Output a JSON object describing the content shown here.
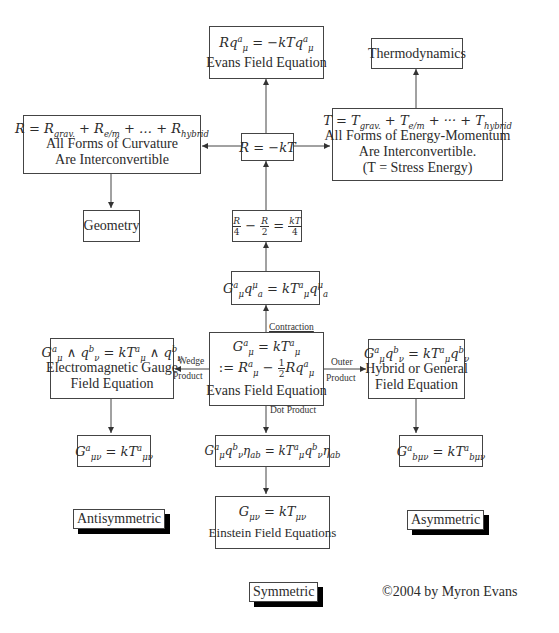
{
  "diagram": {
    "nodes": {
      "evans_top": {
        "equation": "Rq^a_μ = −kTq^a_μ",
        "label": "Evans Field Equation"
      },
      "thermodynamics": {
        "label": "Thermodynamics"
      },
      "curvature": {
        "equation": "R = R_grav. + R_e/m + … + R_hybrid",
        "line1": "All Forms of Curvature",
        "line2": "Are Interconvertible"
      },
      "r_eq": {
        "equation": "R = −kT"
      },
      "energy": {
        "equation": "T = T_grav. + T_e/m + ··· + T_hybrid",
        "line1": "All Forms of Energy-Momentum",
        "line2": "Are Interconvertible.",
        "line3": "(T = Stress Energy)"
      },
      "geometry": {
        "label": "Geometry"
      },
      "fraction_eq": {
        "equation": "R/4 − R/2 = kT/4"
      },
      "contraction_eq": {
        "equation": "G^a_μ q^μ_a = kT^a_μ q^μ_a"
      },
      "evans_center": {
        "equation1": "G^a_μ = kT^a_μ",
        "equation2": ":= R^a_μ − ½Rq^a_μ",
        "label": "Evans Field Equation"
      },
      "em_gauge": {
        "equation": "G^a_μ ∧ q^b_ν = kT^a_μ ∧ q^b_ν",
        "line1": "Electromagnetic Gauge",
        "line2": "Field Equation"
      },
      "hybrid": {
        "equation": "G^a_μ q^b_ν = kT^a_μ q^b_ν",
        "line1": "Hybrid or General",
        "line2": "Field Equation"
      },
      "antisym_eq": {
        "equation": "G^a_μν = kT^a_μν"
      },
      "dot_eq": {
        "equation": "G^a_μ q^b_ν η_ab = kT^a_μ q^b_ν η_ab"
      },
      "asym_eq": {
        "equation": "G^a_bμν = kT^a_bμν"
      },
      "einstein": {
        "equation": "G_μν = kT_μν",
        "label": "Einstein Field Equations"
      }
    },
    "edge_labels": {
      "contraction": "Contraction",
      "wedge1": "Wedge",
      "wedge2": "Product",
      "outer1": "Outer",
      "outer2": "Product",
      "dot": "Dot Product"
    },
    "categories": {
      "antisymmetric": "Antisymmetric",
      "asymmetric": "Asymmetric",
      "symmetric": "Symmetric"
    },
    "copyright": "©2004 by Myron Evans"
  }
}
